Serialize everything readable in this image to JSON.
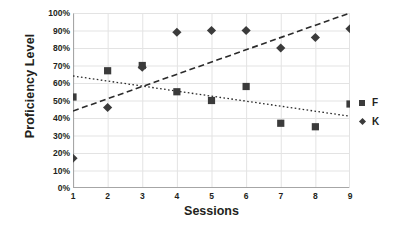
{
  "chart_data": {
    "type": "scatter",
    "title": "",
    "xlabel": "Sessions",
    "ylabel": "Proficiency Level",
    "x": [
      1,
      2,
      3,
      4,
      5,
      6,
      7,
      8,
      9
    ],
    "xtick_labels": [
      "1",
      "2",
      "3",
      "4",
      "5",
      "6",
      "7",
      "8",
      "9"
    ],
    "ytick_labels": [
      "0%",
      "10%",
      "20%",
      "30%",
      "40%",
      "50%",
      "60%",
      "70%",
      "80%",
      "90%",
      "100%"
    ],
    "ytick_values": [
      0,
      10,
      20,
      30,
      40,
      50,
      60,
      70,
      80,
      90,
      100
    ],
    "ylim": [
      0,
      100
    ],
    "xlim": [
      1,
      9
    ],
    "grid": true,
    "legend_position": "right",
    "marker_color": "#3b3b3b",
    "gridline_color": "#e3e3e3",
    "axis_color": "#a6a6a6",
    "series": [
      {
        "name": "F",
        "marker": "square",
        "values": [
          52,
          67,
          70,
          55,
          50,
          58,
          37,
          35,
          48
        ],
        "trendline": {
          "style": "dotted",
          "start_value": 64,
          "end_value": 41
        }
      },
      {
        "name": "K",
        "marker": "diamond",
        "values": [
          17,
          46,
          69,
          89,
          90,
          90,
          80,
          86,
          91
        ],
        "trendline": {
          "style": "dashed",
          "start_value": 44,
          "end_value": 100
        }
      }
    ]
  },
  "legend": {
    "items": [
      {
        "label": "F",
        "marker": "square"
      },
      {
        "label": "K",
        "marker": "diamond"
      }
    ]
  }
}
